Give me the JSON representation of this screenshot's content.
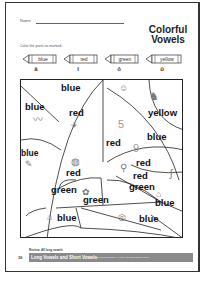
{
  "worksheet": {
    "name_label": "Name",
    "title_line1": "Colorful",
    "title_line2": "Vowels",
    "instructions": "Color the parts as marked.",
    "key": [
      {
        "color_word": "blue",
        "vowel": "a",
        "vowel_display": "ā"
      },
      {
        "color_word": "red",
        "vowel": "i",
        "vowel_display": "ī"
      },
      {
        "color_word": "green",
        "vowel": "o",
        "vowel_display": "ō"
      },
      {
        "color_word": "yellow",
        "vowel": "u",
        "vowel_display": "ū"
      }
    ],
    "regions": [
      {
        "label": "blue",
        "icon": "none"
      },
      {
        "label": "blue",
        "icon": "worm-icon"
      },
      {
        "label": "red",
        "icon": "kite-icon"
      },
      {
        "label": "red",
        "icon": "number-five-icon"
      },
      {
        "label": "yellow",
        "icon": "horse-icon"
      },
      {
        "label": "blue",
        "icon": "none"
      },
      {
        "label": "red",
        "icon": "number-nine-icon"
      },
      {
        "label": "blue",
        "icon": "pencil-icon"
      },
      {
        "label": "red",
        "icon": "globe-icon"
      },
      {
        "label": "red",
        "icon": "bicycle-icon"
      },
      {
        "label": "green",
        "icon": "rope-icon"
      },
      {
        "label": "green",
        "icon": "flower-icon"
      },
      {
        "label": "green",
        "icon": "coat-icon"
      },
      {
        "label": "blue",
        "icon": "cane-icon"
      },
      {
        "label": "blue",
        "icon": "house-icon"
      },
      {
        "label": "blue",
        "icon": "snail-icon"
      }
    ],
    "review_note": "Review: All long vowels",
    "page_number": "36",
    "footer_title": "Long Vowels and Short Vowels",
    "footer_fine_print": "Total Reading Grade 1 - Long Vowels and Short Vowels"
  }
}
